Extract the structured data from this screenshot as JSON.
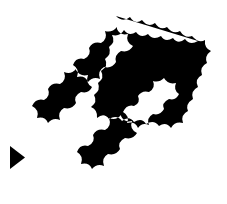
{
  "canvas": {
    "width": 227,
    "height": 204,
    "background_color": "#ffffff"
  },
  "graphic": {
    "name": "scalloped-diamond-lattice",
    "description": "Black rotated-square (diamond) lattice with wavy scalloped edges enclosing four diamond-shaped white openings",
    "fill_color": "#000000",
    "hole_color": "#ffffff",
    "orientation": "diamond",
    "hole_count": 4,
    "bounds": {
      "left": 25,
      "top": 15,
      "right": 208,
      "bottom": 190
    },
    "apexes": {
      "top": [
        116,
        16
      ],
      "right": [
        207,
        110
      ],
      "bottom": [
        122,
        189
      ],
      "left": [
        26,
        95
      ]
    },
    "scallop": {
      "bump_radius": 9,
      "bumps_per_edge": 7
    },
    "holes": [
      {
        "id": "hole-top",
        "center": [
          117,
          60
        ],
        "radius_x": 34,
        "radius_y": 34
      },
      {
        "id": "hole-left",
        "center": [
          76,
          101
        ],
        "radius_x": 32,
        "radius_y": 32
      },
      {
        "id": "hole-right",
        "center": [
          164,
          106
        ],
        "radius_x": 29,
        "radius_y": 29
      },
      {
        "id": "hole-bottom",
        "center": [
          121,
          147
        ],
        "radius_x": 32,
        "radius_y": 32
      }
    ]
  },
  "cursor": {
    "name": "play-triangle-cursor",
    "shape": "triangle",
    "fill_color": "#000000",
    "position": {
      "x": 10,
      "y": 146
    },
    "size": {
      "width": 15,
      "height": 23
    },
    "direction": "right"
  }
}
